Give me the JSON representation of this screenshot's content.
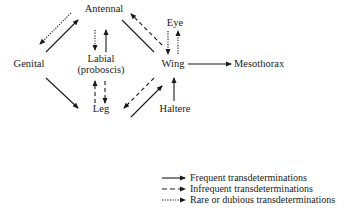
{
  "diagram": {
    "type": "transdetermination-graph",
    "nodes": {
      "antennal": "Antennal",
      "eye": "Eye",
      "genital": "Genital",
      "labial_line1": "Labial",
      "labial_line2": "(proboscis)",
      "wing": "Wing",
      "mesothorax": "Mesothorax",
      "leg": "Leg",
      "haltere": "Haltere"
    },
    "edges": [
      {
        "from": "Genital",
        "to": "Antennal",
        "style": "frequent"
      },
      {
        "from": "Antennal",
        "to": "Genital",
        "style": "rare"
      },
      {
        "from": "Antennal",
        "to": "Labial",
        "style": "rare"
      },
      {
        "from": "Labial",
        "to": "Antennal",
        "style": "frequent"
      },
      {
        "from": "Wing",
        "to": "Antennal",
        "style": "infrequent"
      },
      {
        "from": "Antennal",
        "to": "Wing",
        "style": "frequent"
      },
      {
        "from": "Eye",
        "to": "Wing",
        "style": "rare"
      },
      {
        "from": "Wing",
        "to": "Eye",
        "style": "rare"
      },
      {
        "from": "Wing",
        "to": "Mesothorax",
        "style": "frequent"
      },
      {
        "from": "Genital",
        "to": "Leg",
        "style": "frequent"
      },
      {
        "from": "Leg",
        "to": "Labial",
        "style": "infrequent"
      },
      {
        "from": "Labial",
        "to": "Leg",
        "style": "infrequent"
      },
      {
        "from": "Wing",
        "to": "Leg",
        "style": "infrequent"
      },
      {
        "from": "Leg",
        "to": "Wing",
        "style": "frequent"
      },
      {
        "from": "Haltere",
        "to": "Wing",
        "style": "frequent"
      }
    ],
    "colors": {
      "ink": "#1a1a1a",
      "background": "#ffffff"
    }
  },
  "legend": {
    "items": [
      {
        "style": "solid",
        "label": "Frequent transdeterminations"
      },
      {
        "style": "dashed",
        "label": "Infrequent transdeterminations"
      },
      {
        "style": "dotted",
        "label": "Rare or dubious transdeterminations"
      }
    ]
  }
}
